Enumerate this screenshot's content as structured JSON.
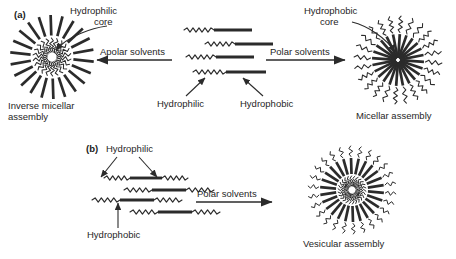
{
  "figure": {
    "type": "amphiphile-self-assembly-schematic",
    "panels": [
      {
        "tag": "(a)",
        "tag_x": 14,
        "tag_y": 9,
        "description": "Single-headed amphiphile assembling into inverse micelle in apolar solvents or micelle in polar solvents",
        "monomer_type": "amphiphile",
        "labels": {
          "left_core": "Hydrophilic\ncore",
          "left_core_line1": "Hydrophilic",
          "left_core_line2": "core",
          "left_assembly_line1": "Inverse micellar",
          "left_assembly_line2": "assembly",
          "right_core_line1": "Hydrophobic",
          "right_core_line2": "core",
          "right_assembly": "Micellar assembly",
          "monomer_hydrophilic": "Hydrophilic",
          "monomer_hydrophobic": "Hydrophobic",
          "arrow_left": "Apolar solvents",
          "arrow_right": "Polar solvents"
        }
      },
      {
        "tag": "(b)",
        "tag_x": 86,
        "tag_y": 143,
        "description": "Bolaamphiphile with hydrophilic segments at both ends assembling into vesicle in polar solvents",
        "monomer_type": "bolaamphiphile",
        "labels": {
          "monomer_hydrophilic": "Hydrophilic",
          "monomer_hydrophobic": "Hydrophobic",
          "arrow_right": "Polar solvents",
          "assembly": "Vesicular assembly"
        }
      }
    ]
  },
  "colors": {
    "stroke": "#2b2b2b",
    "text": "#262626",
    "background": "#ffffff"
  },
  "geometry": {
    "inverse_micelle": {
      "cx": 52,
      "cy": 57,
      "arms": 22,
      "tail_outer": 42,
      "head_inner": 6
    },
    "micelle": {
      "cx": 398,
      "cy": 60,
      "arms": 24,
      "core_radius": 26,
      "head_outer": 44
    },
    "vesicle": {
      "cx": 352,
      "cy": 190,
      "arms": 26,
      "inner": 10,
      "outer": 44
    }
  }
}
